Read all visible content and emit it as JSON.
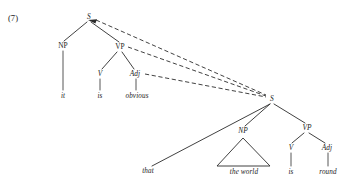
{
  "figure": {
    "example_number": "(7)",
    "kind": "syntax-tree",
    "background_color": "#ffffff",
    "ink_color": "#2b2b2b"
  },
  "matrix_clause": {
    "root_label": "S",
    "nodes": [
      {
        "id": "s-top",
        "label": "S",
        "style": "italic",
        "x": 89,
        "y": 17
      },
      {
        "id": "np-top",
        "label": "NP",
        "style": "roman",
        "x": 63,
        "y": 46
      },
      {
        "id": "vp-top",
        "label": "VP",
        "style": "roman",
        "x": 120,
        "y": 47
      },
      {
        "id": "v-top",
        "label": "V",
        "style": "italic",
        "x": 100,
        "y": 74
      },
      {
        "id": "adj-top",
        "label": "Adj",
        "style": "italic",
        "x": 135,
        "y": 74
      }
    ],
    "terminals": [
      {
        "id": "term-it",
        "label": "it",
        "x": 63,
        "y": 97
      },
      {
        "id": "term-is",
        "label": "is",
        "x": 100,
        "y": 97
      },
      {
        "id": "term-obvious",
        "label": "obvious",
        "x": 137,
        "y": 97
      }
    ]
  },
  "embedded_clause": {
    "root_label": "S",
    "nodes": [
      {
        "id": "s-low",
        "label": "S",
        "style": "italic",
        "x": 272,
        "y": 99
      },
      {
        "id": "np-low",
        "label": "NP",
        "style": "italic",
        "x": 243,
        "y": 131
      },
      {
        "id": "vp-low",
        "label": "VP",
        "style": "italic",
        "x": 307,
        "y": 128
      },
      {
        "id": "v-low",
        "label": "V",
        "style": "italic",
        "x": 291,
        "y": 148
      },
      {
        "id": "adj-low",
        "label": "Adj",
        "style": "italic",
        "x": 327,
        "y": 148
      }
    ],
    "terminals": [
      {
        "id": "term-that",
        "label": "that",
        "x": 148,
        "y": 172
      },
      {
        "id": "term-the-world",
        "label": "the world",
        "x": 244,
        "y": 173
      },
      {
        "id": "term-is-low",
        "label": "is",
        "x": 291,
        "y": 173
      },
      {
        "id": "term-round",
        "label": "round",
        "x": 328,
        "y": 173
      }
    ],
    "triangle": {
      "apex_x": 243,
      "apex_y": 138,
      "left_x": 217,
      "right_x": 270,
      "base_y": 166
    }
  },
  "movement_links": [
    {
      "id": "link-s-to-s",
      "from": "s-top",
      "to": "s-low",
      "style": "dashed"
    },
    {
      "id": "link-vp-to-s",
      "from": "vp-top",
      "to": "s-low",
      "style": "dashed"
    },
    {
      "id": "link-adj-to-s",
      "from": "adj-top",
      "to": "s-low",
      "style": "dashed"
    }
  ],
  "sentence": {
    "matrix": "it is obvious",
    "embedded": "that the world is round",
    "full": "it is obvious that the world is round"
  }
}
